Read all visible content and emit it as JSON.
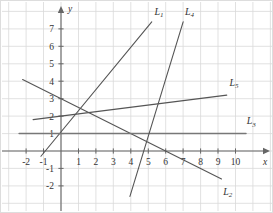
{
  "figure": {
    "title": "",
    "border_color": "#d8d8d8",
    "grid_color": "#d9d9d9",
    "axis_color": "#666666",
    "line_color": "#555555",
    "background": "#ffffff"
  },
  "axes": {
    "x_label": "x",
    "y_label": "y",
    "x_ticks": [
      "-2",
      "-1",
      "1",
      "2",
      "3",
      "4",
      "5",
      "6",
      "7",
      "8",
      "9",
      "10"
    ],
    "x_tick_values": [
      -2,
      -1,
      1,
      2,
      3,
      4,
      5,
      6,
      7,
      8,
      9,
      10
    ],
    "y_ticks": [
      "7",
      "6",
      "5",
      "4",
      "3",
      "2",
      "1",
      "-1",
      "-2"
    ],
    "y_tick_values": [
      7,
      6,
      5,
      4,
      3,
      2,
      1,
      -1,
      -2
    ],
    "xlim": [
      -2.6,
      10.9
    ],
    "ylim": [
      -2.9,
      7.8
    ],
    "grid": true
  },
  "chart_data": {
    "type": "line",
    "title": "",
    "xlabel": "x",
    "ylabel": "y",
    "xlim": [
      -2.6,
      10.9
    ],
    "ylim": [
      -2.9,
      7.8
    ],
    "grid": true,
    "legend": "inline-end-labels",
    "series": [
      {
        "name": "L1",
        "label": "L_1",
        "slope": 2,
        "intercept": 2,
        "equation": "y = 2x + 2",
        "x": [
          -1.15,
          5.2
        ],
        "y": [
          -0.3,
          12.4
        ],
        "segment": [
          [
            -1.15,
            -0.3
          ],
          [
            5.2,
            7.4
          ]
        ],
        "label_pos": [
          5.35,
          7.8
        ]
      },
      {
        "name": "L2",
        "label": "L_2",
        "slope": -0.5,
        "intercept": 3,
        "equation": "y = -0.5x + 3",
        "segment": [
          [
            -2.2,
            4.1
          ],
          [
            9.2,
            -1.6
          ]
        ],
        "label_pos": [
          9.3,
          -2.5
        ]
      },
      {
        "name": "L3",
        "label": "L_3",
        "slope": 0,
        "intercept": 1,
        "equation": "y = 1",
        "segment": [
          [
            -2.4,
            1
          ],
          [
            10.6,
            1
          ]
        ],
        "label_pos": [
          10.65,
          1.55
        ]
      },
      {
        "name": "L4",
        "label": "L_4",
        "slope": 3.2,
        "intercept": -15,
        "equation": "y = 3.2x - 15",
        "segment": [
          [
            3.95,
            -2.6
          ],
          [
            7.0,
            7.4
          ]
        ],
        "label_pos": [
          7.1,
          7.8
        ]
      },
      {
        "name": "L5",
        "label": "L_5",
        "slope": 0.125,
        "intercept": 2,
        "equation": "y = 0.125x + 2",
        "segment": [
          [
            -1.6,
            1.8
          ],
          [
            9.5,
            3.2
          ]
        ],
        "label_pos": [
          9.65,
          3.75
        ]
      }
    ]
  }
}
